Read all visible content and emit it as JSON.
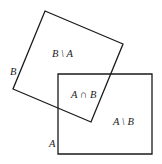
{
  "diagram": {
    "type": "set-difference-illustration",
    "sets": {
      "A": {
        "label": "A",
        "shape": "rectangle",
        "points": "58,74 152,74 152,154 58,154"
      },
      "B": {
        "label": "B",
        "shape": "rotated-square",
        "points": "45,11 123,44 91,122 13,89"
      }
    },
    "regions": {
      "b_minus_a": "B \\ A",
      "a_intersect_b": "A ∩ B",
      "a_minus_b": "A \\ B"
    },
    "colors": {
      "stroke": "#1a1a1a",
      "text": "#222222",
      "background": "#ffffff"
    }
  }
}
